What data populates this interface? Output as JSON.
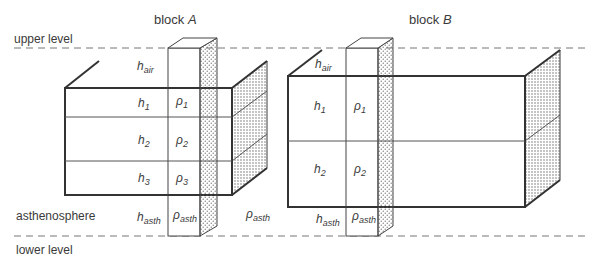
{
  "diagram": {
    "type": "isostasy block comparison",
    "levels": {
      "upper": "upper level",
      "lower": "lower level",
      "asthenosphere": "asthenosphere"
    },
    "blocks": [
      {
        "title_prefix": "block ",
        "title_var": "A",
        "air": {
          "h": "h",
          "h_sub": "air"
        },
        "layers": [
          {
            "h": "h",
            "h_sub": "1",
            "rho": "ρ",
            "rho_sub": "1"
          },
          {
            "h": "h",
            "h_sub": "2",
            "rho": "ρ",
            "rho_sub": "2"
          },
          {
            "h": "h",
            "h_sub": "3",
            "rho": "ρ",
            "rho_sub": "3"
          }
        ],
        "asth": {
          "h": "h",
          "h_sub": "asth",
          "rho": "ρ",
          "rho_sub": "asth"
        },
        "outside_rho": {
          "rho": "ρ",
          "rho_sub": "asth"
        }
      },
      {
        "title_prefix": "block ",
        "title_var": "B",
        "air": {
          "h": "h",
          "h_sub": "air"
        },
        "layers": [
          {
            "h": "h",
            "h_sub": "1",
            "rho": "ρ",
            "rho_sub": "1"
          },
          {
            "h": "h",
            "h_sub": "2",
            "rho": "ρ",
            "rho_sub": "2"
          }
        ],
        "asth": {
          "h": "h",
          "h_sub": "asth",
          "rho": "ρ",
          "rho_sub": "asth"
        }
      }
    ],
    "colors": {
      "line": "#3a3a3a",
      "dash": "#777777",
      "stipple": "#555555"
    }
  }
}
